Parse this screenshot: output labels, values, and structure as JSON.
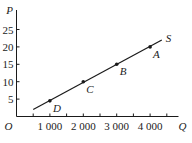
{
  "chart_data": {
    "type": "line",
    "title": "",
    "xlabel": "Q",
    "ylabel": "P",
    "origin_label": "O",
    "xlim": [
      0,
      5000
    ],
    "ylim": [
      0,
      30
    ],
    "x_ticks": [
      500,
      1000,
      1500,
      2000,
      2500,
      3000,
      3500,
      4000,
      4500
    ],
    "x_tick_labels": [
      {
        "value": 1000,
        "label": "1 000"
      },
      {
        "value": 2000,
        "label": "2 000"
      },
      {
        "value": 3000,
        "label": "3 000"
      },
      {
        "value": 4000,
        "label": "4 000"
      }
    ],
    "y_ticks": [
      5,
      10,
      15,
      20,
      25
    ],
    "y_tick_labels": [
      "5",
      "10",
      "15",
      "20",
      "25"
    ],
    "grid": false,
    "series": [
      {
        "name": "S",
        "line": {
          "x_start": 500,
          "y_start": 2,
          "x_end": 4350,
          "y_end": 22
        },
        "points": [
          {
            "label": "D",
            "x": 1000,
            "y": 4.5
          },
          {
            "label": "C",
            "x": 2000,
            "y": 10
          },
          {
            "label": "B",
            "x": 3000,
            "y": 15
          },
          {
            "label": "A",
            "x": 4000,
            "y": 20
          }
        ]
      }
    ]
  },
  "colors": {
    "line": "#1a1a1a",
    "text": "#222222",
    "background": "#ffffff"
  }
}
